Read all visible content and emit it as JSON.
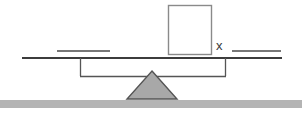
{
  "diagram": {
    "type": "balance-scale",
    "title": "",
    "labels": {
      "unknown_box": "x"
    },
    "colors": {
      "stroke": "#555555",
      "beam": "#3c3c3c",
      "fulcrum_fill": "#a8a8a8",
      "fulcrum_stroke": "#555555",
      "box_fill": "#ffffff",
      "box_stroke": "#8a8a8a",
      "ground": "#b4b4b4",
      "background": "#ffffff"
    },
    "elements": {
      "left_pan_line": {
        "name": "left-pan-surface",
        "x1": 57,
        "x2": 110,
        "y": 51
      },
      "right_pan_line": {
        "name": "right-pan-surface",
        "x1": 232,
        "x2": 281,
        "y": 51
      },
      "beam": {
        "name": "balance-beam",
        "x1": 22,
        "x2": 282,
        "y": 58
      },
      "left_hanger": {
        "name": "left-hanger",
        "x": 80,
        "y_top": 58,
        "y_bottom": 76
      },
      "right_hanger": {
        "name": "right-hanger",
        "x": 225,
        "y_top": 58,
        "y_bottom": 76
      },
      "cross_bar": {
        "name": "hanger-cross-bar",
        "x1": 80,
        "x2": 225,
        "y": 76
      },
      "fulcrum": {
        "name": "fulcrum-triangle",
        "apex_x": 152,
        "apex_y": 71,
        "left_x": 128,
        "right_x": 176,
        "base_y": 99
      },
      "unknown_box": {
        "name": "unknown-quantity-box",
        "x": 168,
        "y": 5,
        "width": 44,
        "height": 50
      },
      "x_label_pos": {
        "x": 216,
        "y": 49
      },
      "ground": {
        "name": "ground-bar",
        "x": 0,
        "y": 100,
        "width": 302,
        "height": 8
      }
    }
  }
}
